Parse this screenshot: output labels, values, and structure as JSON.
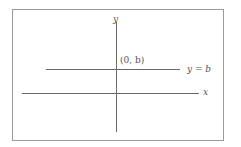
{
  "diagram": {
    "labels": {
      "y_axis": "y",
      "x_axis": "x",
      "point": "(0, b)",
      "line": "y = b"
    },
    "colors": {
      "lines": "#6a6a6a",
      "frame": "#9a9a9a",
      "text": "#555555"
    }
  }
}
